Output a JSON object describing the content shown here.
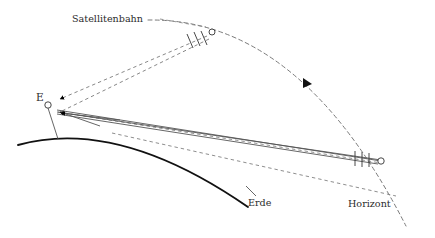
{
  "figure": {
    "title_text": "",
    "width": 435,
    "height": 238,
    "background_color": "#ffffff"
  },
  "labels": {
    "satellitenbahn": "Satellitenbahn",
    "erde": "Erde",
    "horizont": "Horizont",
    "observer": "E"
  },
  "colors": {
    "earth_arc": "#111111",
    "orbit_dashed": "#7a7a7a",
    "sight_line": "#555555",
    "label_text": "#2b2b2b",
    "marker_stroke": "#333333",
    "arrow_fill": "#000000"
  },
  "elements": {
    "earth_arc_name": "Erde",
    "orbit_curve_name": "Satellitenbahn",
    "horizon_point_name": "Horizont",
    "observer_point_name": "E",
    "satellite_marker_name": "Satellit",
    "orbit_direction_arrow": "Bewegungsrichtung"
  },
  "markers": {
    "observer": {
      "x": 48,
      "y": 105,
      "r": 3.2
    },
    "satellite": {
      "x": 210,
      "y": 33,
      "r": 3.0
    },
    "horizon": {
      "x": 381,
      "y": 161,
      "r": 3.2
    }
  },
  "tick_groups": {
    "satellite_ticks_count": 3,
    "horizon_ticks_count": 3
  },
  "geometry": {
    "earth_arc_path": "M 18,145 Q 118,117 248,207",
    "orbit_path": "M 148,20 Q 300,18 406,226",
    "observer_stem": {
      "x1": 48,
      "y1": 108,
      "x2": 58,
      "y2": 138
    },
    "sight_lines": 3,
    "dashed_sight_lines": 2
  }
}
